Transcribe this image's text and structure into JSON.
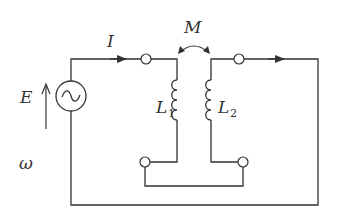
{
  "diagram": {
    "type": "circuit",
    "colors": {
      "stroke": "#333333",
      "background": "#ffffff"
    },
    "labels": {
      "current": "I",
      "mutual_inductance": "M",
      "emf": "E",
      "angular_frequency": "ω",
      "inductor1": {
        "main": "L",
        "sub": "1"
      },
      "inductor2": {
        "main": "L",
        "sub": "2"
      }
    },
    "components": [
      {
        "id": "source",
        "kind": "ac-voltage-source",
        "label": "E"
      },
      {
        "id": "L1",
        "kind": "inductor",
        "label": "L1"
      },
      {
        "id": "L2",
        "kind": "inductor",
        "label": "L2"
      },
      {
        "id": "coupling",
        "kind": "mutual-inductance",
        "label": "M"
      },
      {
        "id": "t1",
        "kind": "terminal"
      },
      {
        "id": "t2",
        "kind": "terminal"
      },
      {
        "id": "t3",
        "kind": "terminal"
      },
      {
        "id": "t4",
        "kind": "terminal"
      }
    ]
  }
}
